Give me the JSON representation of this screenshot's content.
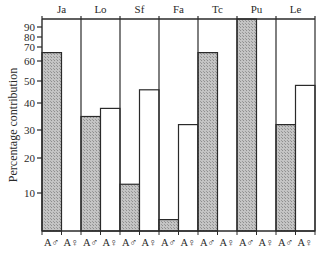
{
  "chart_data": {
    "type": "bar",
    "title": "",
    "xlabel": "",
    "ylabel": "Percentage contribution",
    "y_scale": "probability (non-linear, compressed toward 100)",
    "yticks": [
      10,
      20,
      30,
      40,
      50,
      60,
      70,
      80,
      90
    ],
    "ylim": [
      0,
      100
    ],
    "grid": false,
    "legend": null,
    "group_labels": [
      "Ja",
      "Lo",
      "Sf",
      "Fa",
      "Tc",
      "Pu",
      "Le"
    ],
    "bar_labels": [
      "A♂",
      "A♀"
    ],
    "fill_styles": {
      "A♂": "stippled grey",
      "A♀": "white / open"
    },
    "series": [
      {
        "name": "A♂",
        "values": [
          66,
          35,
          12.5,
          3,
          66,
          100,
          32
        ]
      },
      {
        "name": "A♀",
        "values": [
          0,
          38,
          46,
          32,
          0,
          0,
          48
        ]
      }
    ],
    "categories": [
      "Ja",
      "Lo",
      "Sf",
      "Fa",
      "Tc",
      "Pu",
      "Le"
    ]
  },
  "axis": {
    "ylabel": "Percentage contribution",
    "tick_labels": [
      "10",
      "20",
      "30",
      "40",
      "50",
      "60",
      "70",
      "80",
      "90"
    ]
  },
  "colors": {
    "stipple": "#b8b8b8",
    "line": "#2a2a2a"
  }
}
